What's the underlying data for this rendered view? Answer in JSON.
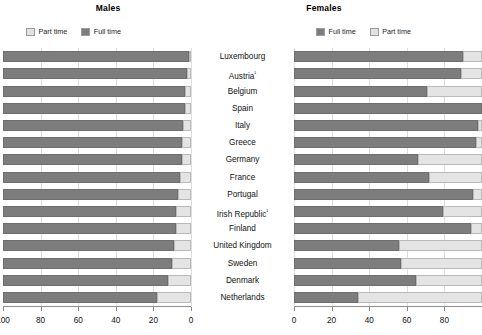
{
  "panels": {
    "left": {
      "title": "Males",
      "legend": [
        {
          "label": "Part time",
          "swatch": "part"
        },
        {
          "label": "Full time",
          "swatch": "full"
        }
      ]
    },
    "right": {
      "title": "Females",
      "legend": [
        {
          "label": "Full time",
          "swatch": "full"
        },
        {
          "label": "Part time",
          "swatch": "part"
        }
      ]
    }
  },
  "axes": {
    "left": {
      "ticks": [
        100,
        80,
        60,
        40,
        20,
        0
      ],
      "min": 0,
      "max": 100,
      "reversed": true
    },
    "right": {
      "ticks": [
        0,
        20,
        40,
        60,
        80
      ],
      "min": 0,
      "max": 100,
      "reversed": false
    }
  },
  "colors": {
    "full_time": "#7d7d7d",
    "part_time": "#e4e4e4",
    "grid": "#dedede",
    "axis": "#8c8c8c",
    "text": "#111111"
  },
  "chart_data": {
    "type": "bar",
    "subtitle": "",
    "xlabel": "Percentage of employees",
    "ylabel": "",
    "xlim": [
      0,
      100
    ],
    "grid": true,
    "legend_position": "top",
    "orientation": "horizontal",
    "stacked": true,
    "categories": [
      "Luxembourg",
      "Austria¹",
      "Belgium",
      "Spain",
      "Italy",
      "Greece",
      "Germany",
      "France",
      "Portugal",
      "Irish Republic¹",
      "Finland",
      "United Kingdom",
      "Sweden",
      "Denmark",
      "Netherlands"
    ],
    "panels": [
      {
        "name": "Males",
        "direction": "rtl",
        "series": [
          {
            "name": "Part time",
            "values": [
              1,
              2,
              3,
              3,
              4,
              5,
              5,
              6,
              7,
              8,
              8,
              9,
              10,
              12,
              18
            ]
          },
          {
            "name": "Full time",
            "values": [
              99,
              98,
              97,
              97,
              96,
              95,
              95,
              94,
              93,
              92,
              92,
              91,
              90,
              88,
              82
            ]
          }
        ]
      },
      {
        "name": "Females",
        "direction": "ltr",
        "series": [
          {
            "name": "Full time",
            "values": [
              90,
              89,
              71,
              100,
              98,
              97,
              66,
              72,
              95,
              79,
              94,
              56,
              57,
              65,
              34
            ]
          },
          {
            "name": "Part time",
            "values": [
              10,
              11,
              29,
              0,
              2,
              3,
              34,
              28,
              5,
              21,
              6,
              44,
              43,
              35,
              66
            ]
          }
        ]
      }
    ],
    "footnote": "¹ Austria and Irish Republic"
  }
}
